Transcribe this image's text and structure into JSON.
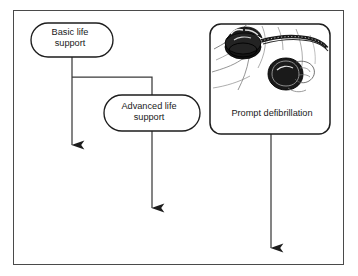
{
  "figure": {
    "background_color": "#ffffff",
    "frame": {
      "border_color": "#4a4a4a",
      "fill_color": "#ffffff"
    },
    "line_color": "#3a3a3a",
    "text_color": "#1a1a1a"
  },
  "nodes": [
    {
      "id": "basic-life-support",
      "label": "Basic life\nsupport",
      "shape": "stadium"
    },
    {
      "id": "advanced-life-support",
      "label": "Advanced life\nsupport",
      "shape": "stadium"
    },
    {
      "id": "prompt-defibrillation",
      "label": "Prompt defibrillation",
      "shape": "rounded-rectangle",
      "illustration": "defibrillation-paddles-on-chest"
    }
  ],
  "connectors": [
    {
      "id": "basic-down-arrow",
      "from": "basic-life-support",
      "style": "straight-down",
      "arrowhead": "solid-triangle"
    },
    {
      "id": "basic-to-advanced-branch",
      "from": "basic-life-support",
      "to": "advanced-life-support",
      "style": "elbow-right",
      "arrowhead": "none"
    },
    {
      "id": "advanced-down-arrow",
      "from": "advanced-life-support",
      "style": "straight-down",
      "arrowhead": "solid-triangle"
    },
    {
      "id": "defibrillation-down-arrow",
      "from": "prompt-defibrillation",
      "style": "straight-down",
      "arrowhead": "solid-triangle"
    }
  ]
}
